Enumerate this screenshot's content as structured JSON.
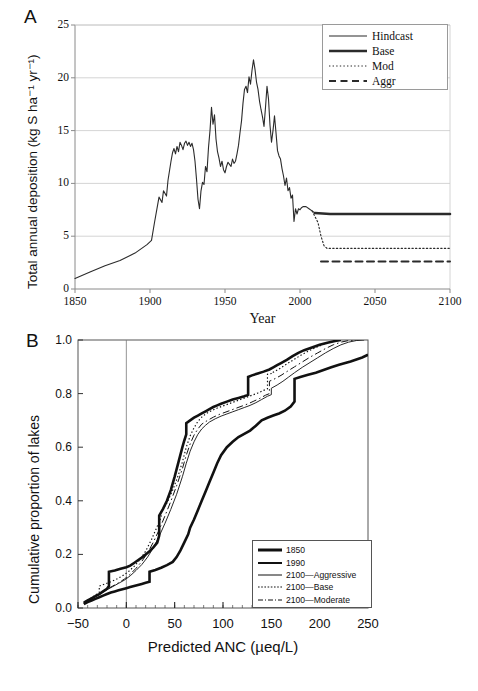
{
  "figure": {
    "panel_a_letter": "A",
    "panel_b_letter": "B"
  },
  "chart_data": [
    {
      "panel": "A",
      "type": "line",
      "title": "",
      "xlabel": "Year",
      "ylabel": "Total annual deposition (kg S ha⁻¹ yr⁻¹)",
      "xlim": [
        1850,
        2100
      ],
      "ylim": [
        0,
        25
      ],
      "xticks": [
        1850,
        1900,
        1950,
        2000,
        2050,
        2100
      ],
      "xtick_labels": [
        "1850",
        "1900",
        "1950",
        "2000",
        "2050",
        "2100"
      ],
      "yticks": [
        0,
        5,
        10,
        15,
        20,
        25
      ],
      "ytick_labels": [
        "0",
        "5",
        "10",
        "15",
        "20",
        "25"
      ],
      "grid": "horizontal",
      "legend_position": "top-right",
      "legend": [
        {
          "label": "Hindcast",
          "style": "solid",
          "width": 1.2
        },
        {
          "label": "Base",
          "style": "solid",
          "width": 2.6
        },
        {
          "label": "Mod",
          "style": "dotted",
          "width": 1.0
        },
        {
          "label": "Aggr",
          "style": "dashed",
          "width": 2.0
        }
      ],
      "series": [
        {
          "name": "Hindcast",
          "style": "solid",
          "x": [
            1850,
            1860,
            1870,
            1880,
            1890,
            1898,
            1901,
            1903,
            1905,
            1906,
            1908,
            1909,
            1911,
            1912,
            1913,
            1914,
            1915,
            1916,
            1917,
            1918,
            1919,
            1920,
            1921,
            1922,
            1923,
            1924,
            1925,
            1926,
            1927,
            1928,
            1929,
            1930,
            1931,
            1932,
            1933,
            1934,
            1935,
            1936,
            1937,
            1938,
            1939,
            1940,
            1941,
            1942,
            1943,
            1944,
            1945,
            1946,
            1947,
            1948,
            1949,
            1950,
            1951,
            1952,
            1953,
            1954,
            1955,
            1956,
            1957,
            1958,
            1959,
            1960,
            1961,
            1962,
            1963,
            1964,
            1965,
            1966,
            1967,
            1968,
            1969,
            1970,
            1971,
            1972,
            1973,
            1974,
            1975,
            1976,
            1977,
            1978,
            1979,
            1980,
            1981,
            1982,
            1983,
            1984,
            1985,
            1986,
            1987,
            1988,
            1989,
            1990,
            1991,
            1992,
            1993,
            1994,
            1995,
            1996,
            1997,
            1998,
            1999,
            2000,
            2001,
            2002,
            2004,
            2006,
            2008,
            2010
          ],
          "y": [
            1.0,
            1.6,
            2.2,
            2.7,
            3.4,
            4.2,
            4.6,
            6.3,
            7.9,
            8.7,
            8.2,
            9.3,
            8.8,
            10.3,
            11.2,
            12.1,
            12.9,
            13.3,
            12.8,
            13.5,
            13.0,
            13.9,
            13.6,
            13.2,
            13.8,
            14.0,
            13.6,
            13.9,
            13.5,
            13.8,
            13.2,
            12.1,
            10.4,
            8.5,
            7.6,
            9.3,
            10.1,
            9.9,
            11.6,
            11.1,
            13.4,
            15.0,
            17.2,
            15.6,
            16.5,
            14.2,
            13.0,
            12.4,
            11.6,
            12.1,
            11.3,
            11.0,
            11.6,
            12.0,
            11.8,
            11.6,
            12.3,
            11.9,
            12.1,
            12.8,
            13.6,
            14.8,
            15.9,
            17.6,
            18.9,
            19.2,
            18.6,
            20.1,
            19.4,
            20.7,
            21.7,
            20.8,
            19.6,
            18.9,
            17.8,
            17.0,
            16.3,
            15.4,
            17.2,
            19.2,
            18.0,
            15.5,
            13.9,
            15.0,
            16.4,
            14.8,
            13.1,
            12.6,
            12.3,
            11.4,
            10.7,
            9.8,
            10.5,
            9.3,
            9.6,
            8.6,
            8.9,
            6.4,
            7.6,
            7.1,
            7.6,
            7.5,
            7.7,
            7.8,
            7.8,
            7.6,
            7.4,
            7.2
          ]
        },
        {
          "name": "Base",
          "style": "solid-thick",
          "x": [
            2010,
            2015,
            2020,
            2050,
            2100
          ],
          "y": [
            7.2,
            7.15,
            7.1,
            7.1,
            7.1
          ]
        },
        {
          "name": "Mod",
          "style": "dotted",
          "x": [
            2008,
            2012,
            2014,
            2016,
            2018,
            2050,
            2100
          ],
          "y": [
            7.4,
            6.3,
            5.0,
            4.1,
            3.85,
            3.85,
            3.85
          ]
        },
        {
          "name": "Aggr",
          "style": "dashed",
          "x": [
            2014,
            2016,
            2018,
            2050,
            2100
          ],
          "y": [
            2.6,
            2.6,
            2.6,
            2.6,
            2.6
          ]
        }
      ]
    },
    {
      "panel": "B",
      "type": "line",
      "title": "",
      "xlabel": "Predicted ANC (µeq/L)",
      "ylabel": "Cumulative proportion of lakes",
      "xlim": [
        -50,
        250
      ],
      "ylim": [
        0.0,
        1.0
      ],
      "xticks": [
        -50,
        0,
        50,
        100,
        150,
        200,
        250
      ],
      "xtick_labels": [
        "−50",
        "0",
        "50",
        "100",
        "150",
        "200",
        "250"
      ],
      "yticks": [
        0.0,
        0.2,
        0.4,
        0.6,
        0.8,
        1.0
      ],
      "ytick_labels": [
        "0.0",
        "0.2",
        "0.4",
        "0.6",
        "0.8",
        "1.0"
      ],
      "grid": "none",
      "zero_reference_line": 0,
      "legend_position": "bottom-right",
      "legend": [
        {
          "label": "1850",
          "style": "solid",
          "width": 3.0
        },
        {
          "label": "1990",
          "style": "solid",
          "width": 2.0
        },
        {
          "label": "2100—Aggressive",
          "style": "solid",
          "width": 1.0
        },
        {
          "label": "2100—Base",
          "style": "dotted",
          "width": 1.2
        },
        {
          "label": "2100—Moderate",
          "style": "dashdot",
          "width": 1.0
        }
      ],
      "series": [
        {
          "name": "1850",
          "style": "solid-thick",
          "x": [
            -44,
            -40,
            -36,
            -32,
            -28,
            -24,
            -20,
            -16,
            -12,
            -8,
            -4,
            0,
            4,
            8,
            12,
            16,
            20,
            24,
            24,
            30,
            36,
            42,
            48,
            52,
            56,
            60,
            64,
            66,
            70,
            74,
            78,
            82,
            86,
            90,
            94,
            98,
            104,
            110,
            116,
            122,
            128,
            134,
            140,
            146,
            152,
            158,
            164,
            170,
            174,
            174,
            180,
            188,
            196,
            204,
            212,
            220,
            232,
            244,
            250
          ],
          "y": [
            0.015,
            0.022,
            0.028,
            0.034,
            0.04,
            0.046,
            0.052,
            0.058,
            0.062,
            0.066,
            0.07,
            0.074,
            0.078,
            0.082,
            0.086,
            0.09,
            0.094,
            0.098,
            0.135,
            0.142,
            0.15,
            0.16,
            0.172,
            0.19,
            0.215,
            0.245,
            0.275,
            0.3,
            0.33,
            0.365,
            0.4,
            0.435,
            0.47,
            0.505,
            0.54,
            0.57,
            0.6,
            0.62,
            0.638,
            0.65,
            0.662,
            0.68,
            0.7,
            0.71,
            0.718,
            0.726,
            0.736,
            0.752,
            0.77,
            0.855,
            0.862,
            0.87,
            0.878,
            0.888,
            0.898,
            0.908,
            0.92,
            0.935,
            0.945
          ]
        },
        {
          "name": "1990",
          "style": "solid-thick",
          "x": [
            -44,
            -40,
            -36,
            -32,
            -28,
            -24,
            -20,
            -18,
            -18,
            -12,
            -6,
            0,
            4,
            8,
            12,
            16,
            20,
            24,
            28,
            32,
            34,
            34,
            38,
            42,
            46,
            50,
            54,
            58,
            60,
            62,
            62,
            66,
            70,
            74,
            78,
            82,
            86,
            90,
            94,
            98,
            104,
            110,
            116,
            122,
            126,
            126,
            130,
            136,
            142,
            148,
            152,
            156,
            160,
            166,
            172,
            178,
            184,
            192,
            200,
            208,
            216,
            222
          ],
          "y": [
            0.02,
            0.028,
            0.036,
            0.044,
            0.052,
            0.062,
            0.072,
            0.082,
            0.135,
            0.14,
            0.146,
            0.152,
            0.158,
            0.168,
            0.178,
            0.188,
            0.2,
            0.212,
            0.226,
            0.244,
            0.27,
            0.345,
            0.37,
            0.4,
            0.44,
            0.49,
            0.545,
            0.6,
            0.625,
            0.648,
            0.69,
            0.7,
            0.71,
            0.718,
            0.726,
            0.734,
            0.742,
            0.75,
            0.756,
            0.762,
            0.77,
            0.778,
            0.784,
            0.79,
            0.795,
            0.862,
            0.868,
            0.875,
            0.882,
            0.89,
            0.898,
            0.906,
            0.914,
            0.926,
            0.94,
            0.952,
            0.962,
            0.972,
            0.982,
            0.99,
            0.996,
            1.0
          ]
        },
        {
          "name": "2100—Aggressive",
          "style": "solid-thin",
          "x": [
            -44,
            -38,
            -32,
            -26,
            -20,
            -14,
            -8,
            -2,
            4,
            10,
            16,
            22,
            28,
            34,
            40,
            46,
            52,
            58,
            62,
            66,
            70,
            74,
            78,
            82,
            86,
            92,
            98,
            104,
            110,
            116,
            122,
            128,
            134,
            140,
            146,
            150,
            150,
            156,
            162,
            168,
            174,
            182,
            190,
            198,
            206,
            214,
            222,
            230,
            238,
            246
          ],
          "y": [
            0.018,
            0.03,
            0.042,
            0.055,
            0.068,
            0.08,
            0.092,
            0.104,
            0.12,
            0.14,
            0.162,
            0.19,
            0.225,
            0.268,
            0.316,
            0.368,
            0.424,
            0.49,
            0.54,
            0.585,
            0.62,
            0.648,
            0.668,
            0.682,
            0.694,
            0.706,
            0.716,
            0.724,
            0.732,
            0.74,
            0.748,
            0.756,
            0.766,
            0.778,
            0.79,
            0.796,
            0.82,
            0.832,
            0.846,
            0.862,
            0.878,
            0.898,
            0.916,
            0.934,
            0.952,
            0.968,
            0.982,
            0.992,
            0.998,
            1.0
          ]
        },
        {
          "name": "2100—Base",
          "style": "dotted",
          "x": [
            -44,
            -38,
            -32,
            -28,
            -28,
            -22,
            -16,
            -10,
            -4,
            2,
            8,
            14,
            20,
            26,
            32,
            36,
            36,
            42,
            48,
            54,
            58,
            62,
            66,
            70,
            74,
            78,
            82,
            88,
            94,
            100,
            106,
            112,
            118,
            124,
            130,
            136,
            142,
            146,
            146,
            152,
            152,
            158,
            164,
            172,
            180,
            188,
            196,
            204,
            212,
            220
          ],
          "y": [
            0.02,
            0.034,
            0.048,
            0.058,
            0.082,
            0.09,
            0.098,
            0.108,
            0.12,
            0.135,
            0.155,
            0.18,
            0.212,
            0.255,
            0.305,
            0.338,
            0.36,
            0.392,
            0.44,
            0.498,
            0.545,
            0.6,
            0.642,
            0.672,
            0.696,
            0.712,
            0.724,
            0.736,
            0.746,
            0.754,
            0.762,
            0.77,
            0.778,
            0.786,
            0.794,
            0.802,
            0.812,
            0.818,
            0.872,
            0.876,
            0.88,
            0.892,
            0.906,
            0.924,
            0.942,
            0.958,
            0.972,
            0.984,
            0.994,
            1.0
          ]
        },
        {
          "name": "2100—Moderate",
          "style": "dashdot",
          "x": [
            -44,
            -38,
            -32,
            -26,
            -20,
            -14,
            -8,
            -2,
            4,
            10,
            16,
            22,
            28,
            34,
            40,
            46,
            52,
            58,
            62,
            66,
            70,
            74,
            78,
            84,
            90,
            96,
            102,
            108,
            114,
            120,
            126,
            132,
            138,
            144,
            148,
            148,
            154,
            160,
            166,
            174,
            182,
            190,
            198,
            206,
            214,
            222,
            230,
            238
          ],
          "y": [
            0.018,
            0.03,
            0.043,
            0.056,
            0.07,
            0.082,
            0.094,
            0.108,
            0.126,
            0.148,
            0.174,
            0.206,
            0.246,
            0.292,
            0.344,
            0.398,
            0.456,
            0.52,
            0.57,
            0.612,
            0.645,
            0.668,
            0.686,
            0.7,
            0.712,
            0.722,
            0.73,
            0.738,
            0.746,
            0.754,
            0.762,
            0.772,
            0.782,
            0.794,
            0.8,
            0.846,
            0.856,
            0.868,
            0.882,
            0.9,
            0.918,
            0.936,
            0.952,
            0.968,
            0.982,
            0.992,
            0.998,
            1.0
          ]
        }
      ]
    }
  ]
}
